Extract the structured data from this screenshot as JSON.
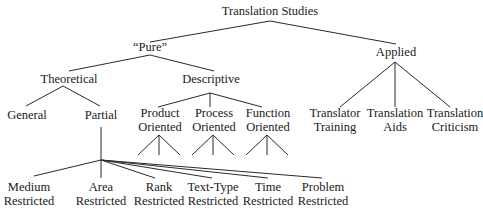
{
  "diagram": {
    "type": "tree",
    "root": "Translation Studies",
    "nodes": {
      "root": {
        "line1": "Translation Studies"
      },
      "pure": {
        "line1": "“Pure”"
      },
      "applied": {
        "line1": "Applied"
      },
      "theoretical": {
        "line1": "Theoretical"
      },
      "descriptive": {
        "line1": "Descriptive"
      },
      "general": {
        "line1": "General"
      },
      "partial": {
        "line1": "Partial"
      },
      "product": {
        "line1": "Product",
        "line2": "Oriented"
      },
      "process": {
        "line1": "Process",
        "line2": "Oriented"
      },
      "function": {
        "line1": "Function",
        "line2": "Oriented"
      },
      "translator_training": {
        "line1": "Translator",
        "line2": "Training"
      },
      "translation_aids": {
        "line1": "Translation",
        "line2": "Aids"
      },
      "translation_criticism": {
        "line1": "Translation",
        "line2": "Criticism"
      },
      "medium": {
        "line1": "Medium",
        "line2": "Restricted"
      },
      "area": {
        "line1": "Area",
        "line2": "Restricted"
      },
      "rank": {
        "line1": "Rank",
        "line2": "Restricted"
      },
      "texttype": {
        "line1": "Text-Type",
        "line2": "Restricted"
      },
      "time": {
        "line1": "Time",
        "line2": "Restricted"
      },
      "problem": {
        "line1": "Problem",
        "line2": "Restricted"
      }
    },
    "edges": [
      [
        "Translation Studies",
        "“Pure”"
      ],
      [
        "Translation Studies",
        "Applied"
      ],
      [
        "“Pure”",
        "Theoretical"
      ],
      [
        "“Pure”",
        "Descriptive"
      ],
      [
        "Theoretical",
        "General"
      ],
      [
        "Theoretical",
        "Partial"
      ],
      [
        "Descriptive",
        "Product Oriented"
      ],
      [
        "Descriptive",
        "Process Oriented"
      ],
      [
        "Descriptive",
        "Function Oriented"
      ],
      [
        "Applied",
        "Translator Training"
      ],
      [
        "Applied",
        "Translation Aids"
      ],
      [
        "Applied",
        "Translation Criticism"
      ],
      [
        "Partial",
        "Medium Restricted"
      ],
      [
        "Partial",
        "Area Restricted"
      ],
      [
        "Partial",
        "Rank Restricted"
      ],
      [
        "Partial",
        "Text-Type Restricted"
      ],
      [
        "Partial",
        "Time Restricted"
      ],
      [
        "Partial",
        "Problem Restricted"
      ]
    ]
  }
}
